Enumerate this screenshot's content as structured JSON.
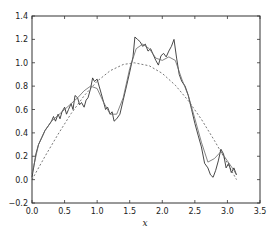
{
  "chart_data": {
    "type": "line",
    "title": "",
    "xlabel": "x",
    "ylabel": "",
    "xlim": [
      0.0,
      3.5
    ],
    "ylim": [
      -0.2,
      1.4
    ],
    "xticks": [
      "0.0",
      "0.5",
      "1.0",
      "1.5",
      "2.0",
      "2.5",
      "3.0",
      "3.5"
    ],
    "yticks": [
      "-0.2",
      "0.0",
      "0.2",
      "0.4",
      "0.6",
      "0.8",
      "1.0",
      "1.2",
      "1.4"
    ],
    "grid": false,
    "legend": null,
    "series": [
      {
        "name": "true function (sin x)",
        "style": "dashed",
        "color": "#555555",
        "x": [
          0.0,
          0.2,
          0.4,
          0.6,
          0.8,
          1.0,
          1.2,
          1.4,
          1.571,
          1.8,
          2.0,
          2.2,
          2.4,
          2.6,
          2.8,
          3.0,
          3.14
        ],
        "y": [
          0.0,
          0.199,
          0.389,
          0.565,
          0.717,
          0.841,
          0.932,
          0.985,
          1.0,
          0.974,
          0.909,
          0.808,
          0.675,
          0.516,
          0.335,
          0.141,
          0.0
        ]
      },
      {
        "name": "noisy signal",
        "style": "solid-jagged",
        "color": "#333333",
        "x": [
          0.0,
          0.03,
          0.06,
          0.1,
          0.15,
          0.2,
          0.25,
          0.3,
          0.33,
          0.36,
          0.4,
          0.43,
          0.46,
          0.5,
          0.53,
          0.56,
          0.6,
          0.63,
          0.66,
          0.7,
          0.73,
          0.76,
          0.8,
          0.83,
          0.86,
          0.9,
          0.93,
          0.96,
          1.0,
          1.03,
          1.06,
          1.1,
          1.13,
          1.16,
          1.2,
          1.23,
          1.26,
          1.3,
          1.35,
          1.4,
          1.45,
          1.5,
          1.55,
          1.58,
          1.62,
          1.66,
          1.7,
          1.74,
          1.78,
          1.82,
          1.86,
          1.9,
          1.94,
          1.98,
          2.02,
          2.06,
          2.1,
          2.14,
          2.18,
          2.22,
          2.26,
          2.3,
          2.35,
          2.4,
          2.45,
          2.5,
          2.55,
          2.6,
          2.65,
          2.7,
          2.74,
          2.78,
          2.82,
          2.86,
          2.9,
          2.94,
          2.98,
          3.02,
          3.06,
          3.1,
          3.14
        ],
        "y": [
          0.02,
          0.12,
          0.22,
          0.3,
          0.36,
          0.42,
          0.46,
          0.5,
          0.54,
          0.5,
          0.56,
          0.52,
          0.58,
          0.62,
          0.56,
          0.6,
          0.65,
          0.6,
          0.72,
          0.7,
          0.64,
          0.66,
          0.62,
          0.68,
          0.7,
          0.78,
          0.87,
          0.84,
          0.86,
          0.8,
          0.74,
          0.66,
          0.6,
          0.62,
          0.56,
          0.58,
          0.5,
          0.52,
          0.56,
          0.68,
          0.8,
          0.92,
          1.05,
          1.22,
          1.2,
          1.18,
          1.14,
          1.16,
          1.1,
          1.12,
          1.07,
          1.02,
          0.98,
          1.06,
          1.08,
          1.05,
          1.1,
          1.14,
          1.2,
          1.04,
          0.9,
          0.84,
          0.8,
          0.72,
          0.6,
          0.48,
          0.38,
          0.28,
          0.14,
          0.1,
          0.04,
          0.02,
          0.08,
          0.16,
          0.26,
          0.22,
          0.1,
          0.14,
          0.06,
          0.1,
          0.04
        ]
      },
      {
        "name": "smoothed fit",
        "style": "solid-smooth",
        "color": "#666666",
        "x": [
          0.0,
          0.1,
          0.2,
          0.3,
          0.4,
          0.5,
          0.6,
          0.7,
          0.8,
          0.9,
          1.0,
          1.1,
          1.2,
          1.3,
          1.4,
          1.5,
          1.6,
          1.7,
          1.8,
          1.9,
          2.0,
          2.1,
          2.2,
          2.3,
          2.4,
          2.5,
          2.6,
          2.7,
          2.8,
          2.9,
          3.0,
          3.1,
          3.14
        ],
        "y": [
          0.05,
          0.3,
          0.42,
          0.5,
          0.55,
          0.6,
          0.65,
          0.7,
          0.76,
          0.8,
          0.78,
          0.66,
          0.56,
          0.56,
          0.7,
          0.95,
          1.12,
          1.16,
          1.12,
          1.04,
          1.02,
          1.05,
          1.02,
          0.86,
          0.72,
          0.52,
          0.32,
          0.15,
          0.18,
          0.24,
          0.16,
          0.08,
          0.04
        ]
      }
    ]
  },
  "colors": {
    "axis": "#333333",
    "background": "#ffffff"
  }
}
